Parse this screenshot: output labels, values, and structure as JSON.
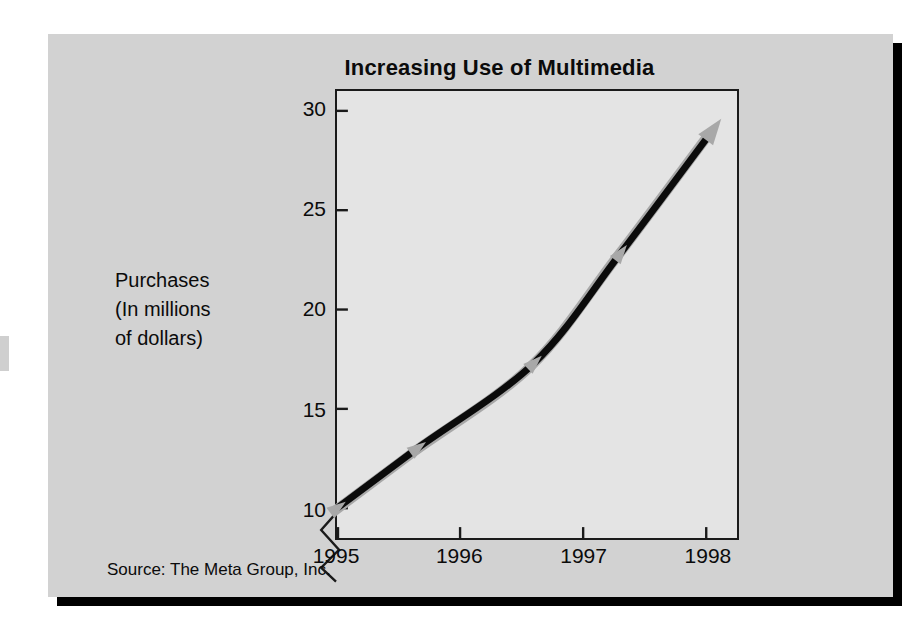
{
  "figure": {
    "title": "Increasing Use of Multimedia",
    "source_note": "Source: The Meta Group, Inc.",
    "y_caption_line1": "Purchases",
    "y_caption_line2": "(In millions",
    "y_caption_line3": "of dollars)",
    "panel_color": "#d2d2d2",
    "plot_bg_color": "#e4e4e4",
    "line_color": "#0b0b0b",
    "marker_color": "#a8a8a8",
    "axis_color": "#1a1a1a"
  },
  "chart_data": {
    "type": "line",
    "title": "Increasing Use of Multimedia",
    "subtitle": "",
    "xlabel": "",
    "ylabel": "Purchases (In millions of dollars)",
    "xlim": [
      1995,
      1998.25
    ],
    "ylim": [
      8.5,
      31
    ],
    "y_axis_broken": true,
    "y_break_below": 10,
    "grid": false,
    "legend": false,
    "x_tick_labels": [
      "1995",
      "1996",
      "1997",
      "1998"
    ],
    "x_ticks": [
      1995,
      1996,
      1997,
      1998
    ],
    "y_tick_labels": [
      "10",
      "15",
      "20",
      "25",
      "30"
    ],
    "y_ticks": [
      10,
      15,
      20,
      25,
      30
    ],
    "annotation": "Source: The Meta Group, Inc.",
    "series": [
      {
        "name": "Purchases",
        "x": [
          1995,
          1995.65,
          1996.6,
          1997.3,
          1998.05
        ],
        "values": [
          10,
          13,
          17.3,
          22.8,
          29
        ],
        "marker": "arrowhead",
        "marker_color": "#a8a8a8",
        "line_color": "#0b0b0b",
        "line_width": 7
      }
    ]
  }
}
